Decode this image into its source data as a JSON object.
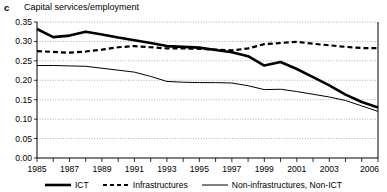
{
  "panel": {
    "letter": "c",
    "title": "Capital services/employment"
  },
  "legend": {
    "position": "bottom-center",
    "items": [
      {
        "label": "ICT",
        "style": "solid-thick",
        "color": "#000000"
      },
      {
        "label": "Infrastructures",
        "style": "dashed",
        "color": "#000000"
      },
      {
        "label": "Non-infrastructures, Non-ICT",
        "style": "solid-thin",
        "color": "#000000"
      }
    ]
  },
  "axes": {
    "y_ticks": [
      "0.00",
      "0.05",
      "0.10",
      "0.15",
      "0.20",
      "0.25",
      "0.30",
      "0.35"
    ],
    "x_ticks": [
      "1985",
      "1987",
      "1989",
      "1991",
      "1993",
      "1995",
      "1997",
      "1999",
      "2001",
      "2003",
      "2006"
    ]
  },
  "chart_data": {
    "type": "line",
    "title": "Capital services/employment",
    "xlabel": "",
    "ylabel": "",
    "xlim": [
      1985,
      2006
    ],
    "ylim": [
      0.0,
      0.35
    ],
    "ytick_step": 0.05,
    "grid": true,
    "grid_style": "dotted-horizontal",
    "legend_position": "bottom-center",
    "x": [
      1985,
      1986,
      1987,
      1988,
      1989,
      1990,
      1991,
      1992,
      1993,
      1994,
      1995,
      1996,
      1997,
      1998,
      1999,
      2000,
      2001,
      2002,
      2003,
      2004,
      2005,
      2006
    ],
    "series": [
      {
        "name": "ICT",
        "style": "solid-thick",
        "color": "#000000",
        "values": [
          0.332,
          0.311,
          0.315,
          0.325,
          0.318,
          0.31,
          0.303,
          0.296,
          0.288,
          0.286,
          0.284,
          0.278,
          0.272,
          0.262,
          0.238,
          0.247,
          0.229,
          0.208,
          0.187,
          0.163,
          0.144,
          0.13
        ]
      },
      {
        "name": "Infrastructures",
        "style": "dashed",
        "color": "#000000",
        "values": [
          0.275,
          0.273,
          0.271,
          0.274,
          0.279,
          0.285,
          0.288,
          0.285,
          0.282,
          0.282,
          0.281,
          0.279,
          0.277,
          0.282,
          0.293,
          0.296,
          0.299,
          0.294,
          0.29,
          0.286,
          0.283,
          0.283
        ]
      },
      {
        "name": "Non-infrastructures, Non-ICT",
        "style": "solid-thin",
        "color": "#000000",
        "values": [
          0.238,
          0.238,
          0.237,
          0.236,
          0.231,
          0.226,
          0.221,
          0.21,
          0.197,
          0.195,
          0.194,
          0.194,
          0.193,
          0.186,
          0.176,
          0.177,
          0.171,
          0.164,
          0.157,
          0.148,
          0.134,
          0.12
        ]
      }
    ]
  }
}
